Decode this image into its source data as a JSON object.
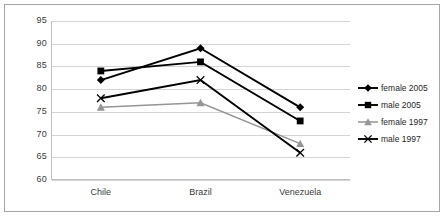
{
  "chart_data": {
    "type": "line",
    "title": "",
    "xlabel": "",
    "ylabel": "",
    "categories": [
      "Chile",
      "Brazil",
      "Venezuela"
    ],
    "ylim": [
      60,
      95
    ],
    "yticks": [
      60,
      65,
      70,
      75,
      80,
      85,
      90,
      95
    ],
    "grid": true,
    "legend_position": "right",
    "series": [
      {
        "name": "female 2005",
        "values": [
          82,
          89,
          76
        ],
        "marker": "diamond",
        "color": "#000000"
      },
      {
        "name": "male 2005",
        "values": [
          84,
          86,
          73
        ],
        "marker": "square",
        "color": "#000000"
      },
      {
        "name": "female 1997",
        "values": [
          76,
          77,
          68
        ],
        "marker": "triangle",
        "color": "#959595"
      },
      {
        "name": "male 1997",
        "values": [
          78,
          82,
          66
        ],
        "marker": "x",
        "color": "#000000"
      }
    ]
  },
  "axis": {
    "y_tick_labels": [
      "95",
      "90",
      "85",
      "80",
      "75",
      "70",
      "65",
      "60"
    ],
    "x_tick_labels": [
      "Chile",
      "Brazil",
      "Venezuela"
    ]
  },
  "legend": {
    "items": [
      {
        "label": "female 2005"
      },
      {
        "label": "male 2005"
      },
      {
        "label": "female 1997"
      },
      {
        "label": "male 1997"
      }
    ]
  }
}
